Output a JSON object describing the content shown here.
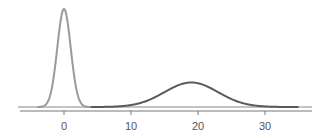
{
  "chart_data": {
    "type": "line",
    "title": "",
    "xlabel": "",
    "ylabel": "",
    "xlim": [
      -4,
      36
    ],
    "xticks": [
      0,
      10,
      20,
      30
    ],
    "xtick_labels": [
      "0",
      "10",
      "20",
      "30"
    ],
    "grid": false,
    "legend": null,
    "series": [
      {
        "name": "distribution-1",
        "kind": "normal density",
        "mean": 0,
        "sd": 1,
        "x_range": [
          -4,
          4
        ],
        "color": "#9a9a9a",
        "relative_peak": 1.0
      },
      {
        "name": "distribution-2",
        "kind": "normal density",
        "mean": 19,
        "sd": 4,
        "x_range": [
          4,
          35
        ],
        "color": "#5a5a5a",
        "relative_peak": 0.25
      }
    ]
  },
  "axis": {
    "ticks": [
      {
        "value": 0,
        "label": "0"
      },
      {
        "value": 10,
        "label": "10"
      },
      {
        "value": 20,
        "label": "20"
      },
      {
        "value": 30,
        "label": "30"
      }
    ]
  }
}
